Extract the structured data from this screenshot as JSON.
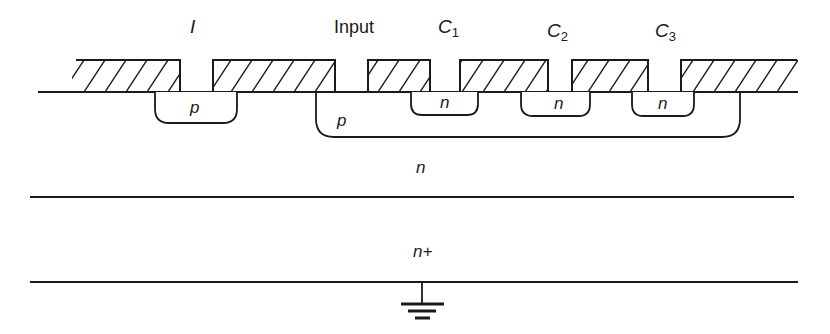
{
  "diagram": {
    "type": "semiconductor cross-section (charge-coupled device)",
    "terminals": {
      "input_gate": "I",
      "input": "Input",
      "c1": "C",
      "c1_sub": "1",
      "c2": "C",
      "c2_sub": "2",
      "c3": "C",
      "c3_sub": "3"
    },
    "regions": {
      "p_small": "p",
      "p_large": "p",
      "n_c1": "n",
      "n_c2": "n",
      "n_c3": "n",
      "n_substrate": "n",
      "n_plus": "n+"
    },
    "ground_symbol": "ground-icon",
    "colors": {
      "ink": "#1a1a1a",
      "background": "#ffffff"
    }
  }
}
